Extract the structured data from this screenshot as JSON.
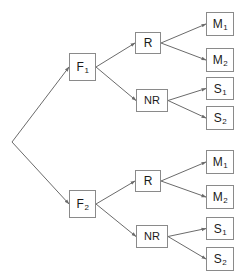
{
  "diagram": {
    "type": "tree",
    "canvas": {
      "width": 249,
      "height": 274
    },
    "style": {
      "node_fill": "#ffffff",
      "node_border": "#8a8a8a",
      "edge_color": "#6b6b6b",
      "text_color": "#1a1a1a"
    },
    "root": {
      "name": "root-vertex",
      "x": 12,
      "y": 142
    },
    "nodes": [
      {
        "id": "f1",
        "label": "F",
        "sub": "1",
        "x": 69,
        "y": 53,
        "w": 27,
        "h": 28
      },
      {
        "id": "f1-r",
        "label": "R",
        "sub": "",
        "x": 135,
        "y": 32,
        "w": 26,
        "h": 22
      },
      {
        "id": "f1-nr",
        "label": "NR",
        "sub": "",
        "x": 136,
        "y": 89,
        "w": 32,
        "h": 23
      },
      {
        "id": "f1-m1",
        "label": "M",
        "sub": "1",
        "x": 206,
        "y": 12,
        "w": 28,
        "h": 24
      },
      {
        "id": "f1-m2",
        "label": "M",
        "sub": "2",
        "x": 206,
        "y": 48,
        "w": 28,
        "h": 24
      },
      {
        "id": "f1-s1",
        "label": "S",
        "sub": "1",
        "x": 206,
        "y": 77,
        "w": 28,
        "h": 23
      },
      {
        "id": "f1-s2",
        "label": "S",
        "sub": "2",
        "x": 206,
        "y": 106,
        "w": 28,
        "h": 24
      },
      {
        "id": "f2",
        "label": "F",
        "sub": "2",
        "x": 69,
        "y": 190,
        "w": 27,
        "h": 28
      },
      {
        "id": "f2-r",
        "label": "R",
        "sub": "",
        "x": 135,
        "y": 170,
        "w": 26,
        "h": 22
      },
      {
        "id": "f2-nr",
        "label": "NR",
        "sub": "",
        "x": 136,
        "y": 225,
        "w": 32,
        "h": 23
      },
      {
        "id": "f2-m1",
        "label": "M",
        "sub": "1",
        "x": 206,
        "y": 150,
        "w": 28,
        "h": 24
      },
      {
        "id": "f2-m2",
        "label": "M",
        "sub": "2",
        "x": 206,
        "y": 185,
        "w": 28,
        "h": 24
      },
      {
        "id": "f2-s1",
        "label": "S",
        "sub": "1",
        "x": 206,
        "y": 217,
        "w": 28,
        "h": 23
      },
      {
        "id": "f2-s2",
        "label": "S",
        "sub": "2",
        "x": 206,
        "y": 247,
        "w": 28,
        "h": 24
      }
    ],
    "edges": [
      {
        "from": "root",
        "to": "f1"
      },
      {
        "from": "root",
        "to": "f2"
      },
      {
        "from": "f1",
        "to": "f1-r"
      },
      {
        "from": "f1",
        "to": "f1-nr"
      },
      {
        "from": "f1-r",
        "to": "f1-m1"
      },
      {
        "from": "f1-r",
        "to": "f1-m2"
      },
      {
        "from": "f1-nr",
        "to": "f1-s1"
      },
      {
        "from": "f1-nr",
        "to": "f1-s2"
      },
      {
        "from": "f2",
        "to": "f2-r"
      },
      {
        "from": "f2",
        "to": "f2-nr"
      },
      {
        "from": "f2-r",
        "to": "f2-m1"
      },
      {
        "from": "f2-r",
        "to": "f2-m2"
      },
      {
        "from": "f2-nr",
        "to": "f2-s1"
      },
      {
        "from": "f2-nr",
        "to": "f2-s2"
      }
    ]
  }
}
